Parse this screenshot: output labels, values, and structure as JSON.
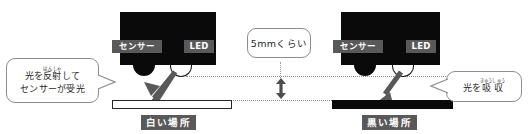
{
  "diagram": {
    "colors": {
      "device_body": "#0a0a0a",
      "label_chip": "#595959",
      "label_text": "#ffffff",
      "bubble_border": "#8d8d8d",
      "guide_line": "#8a8a8a",
      "arrow": "#595959",
      "black_surface": "#0a0a0a",
      "white_surface": "#ffffff"
    }
  },
  "left_scene": {
    "sensor_label": "センサー",
    "led_label": "LED",
    "surface_caption": "白い場所",
    "bubble": {
      "line1_before": "光を",
      "line1_ruby_base": "反射",
      "line1_ruby_text": "はんしゃ",
      "line1_after": "して",
      "line2": "センサーが受光"
    }
  },
  "right_scene": {
    "sensor_label": "センサー",
    "led_label": "LED",
    "surface_caption": "黒い場所",
    "bubble": {
      "before": "光を",
      "ruby_base": "吸収",
      "ruby_text": "きゅうしゅう"
    }
  },
  "gap_annotation": {
    "label": "5mmくらい"
  }
}
